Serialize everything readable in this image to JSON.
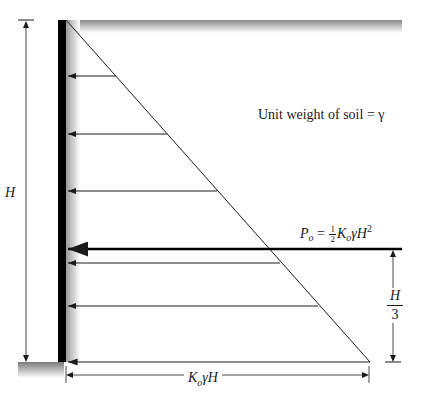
{
  "figure": {
    "type": "at-rest lateral earth pressure distribution on a retaining wall",
    "labels": {
      "unit_weight": "Unit weight of soil = γ",
      "wall_height": "H",
      "resultant_P": "P",
      "resultant_P_sub": "o",
      "resultant_eq": " = ",
      "half_num": "1",
      "half_den": "2",
      "resultant_K": "K",
      "resultant_K_sub": "o",
      "resultant_rest": "γH",
      "resultant_exp": "2",
      "lever_num": "H",
      "lever_den": "3",
      "base_K": "K",
      "base_K_sub": "o",
      "base_rest": "γH"
    },
    "geometry": {
      "wall_top_y": 20,
      "wall_base_y": 362,
      "wall_x": 62,
      "base_pressure_x": 370,
      "resultant_y": 249,
      "pressure_arrow_ys": [
        76,
        134,
        191,
        263,
        306
      ]
    },
    "colors": {
      "line": "#1a1a1a",
      "wall": "#000000",
      "shade": "#bdbdbd"
    }
  }
}
